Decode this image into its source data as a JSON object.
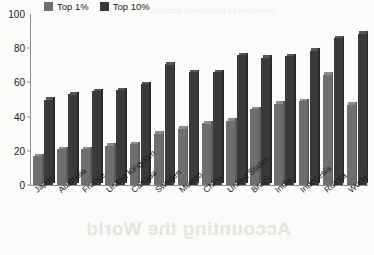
{
  "chart_data": {
    "type": "bar",
    "title": "",
    "xlabel": "",
    "ylabel": "",
    "ylim": [
      0,
      100
    ],
    "yticks": [
      0,
      20,
      40,
      60,
      80,
      100
    ],
    "grid": false,
    "legend_position": "top-left",
    "categories": [
      "Japan",
      "Australia",
      "France",
      "United Kingdom",
      "Canada",
      "Sweden",
      "Mexico",
      "China",
      "United States",
      "Brazil",
      "India",
      "Indonesia",
      "Russia",
      "World"
    ],
    "series": [
      {
        "name": "Top 1%",
        "color": "#6e6e6e",
        "values": [
          17,
          21,
          21,
          23,
          24,
          30,
          33,
          36,
          37.5,
          44.5,
          47.5,
          49,
          64.5,
          47
        ]
      },
      {
        "name": "Top 10%",
        "color": "#3a3a3a",
        "values": [
          50,
          53,
          55,
          55.5,
          59,
          70.5,
          66,
          66,
          76,
          74.5,
          75.5,
          78.5,
          86,
          88.5
        ]
      }
    ]
  },
  "axis": {
    "y_tick_labels": [
      "0",
      "20",
      "40",
      "60",
      "80",
      "100"
    ]
  },
  "legend": {
    "items": [
      {
        "label": "Top 1%",
        "swatch": "#6e6e6e"
      },
      {
        "label": "Top 10%",
        "swatch": "#3a3a3a"
      }
    ]
  },
  "page_bleed": {
    "heading_showthrough": "Accounting the World",
    "line_showthrough": "measured by the national accounts"
  }
}
